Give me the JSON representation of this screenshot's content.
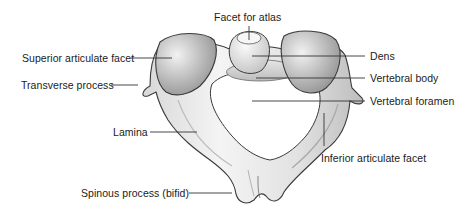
{
  "diagram": {
    "labels": {
      "facet_for_atlas": "Facet for atlas",
      "superior_articulate_facet": "Superior articulate facet",
      "transverse_process": "Transverse process",
      "lamina": "Lamina",
      "spinous_process": "Spinous process (bifid)",
      "dens": "Dens",
      "vertebral_body": "Vertebral body",
      "vertebral_foramen": "Vertebral foramen",
      "inferior_articulate_facet": "Inferior articulate facet"
    },
    "colors": {
      "background": "#ffffff",
      "bone_light": "#ececec",
      "bone_mid": "#cfcfcf",
      "bone_dark": "#9a9a9a",
      "outline": "#3a3a3a",
      "leader_line": "#333333",
      "text": "#222222"
    }
  }
}
